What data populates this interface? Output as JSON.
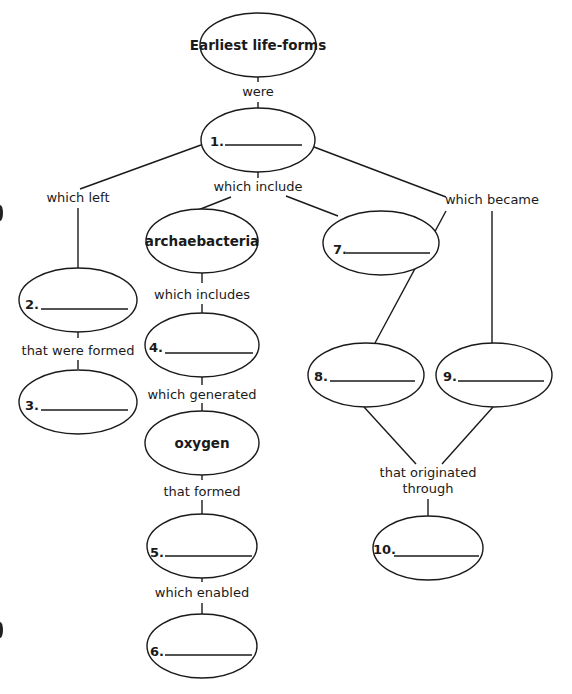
{
  "diagram": {
    "type": "concept-map",
    "nodes": {
      "root": "Earliest life-forms",
      "n1": "1.",
      "n2": "2.",
      "n3": "3.",
      "archaebacteria": "archaebacteria",
      "n4": "4.",
      "oxygen": "oxygen",
      "n5": "5.",
      "n6": "6.",
      "n7": "7.",
      "n8": "8.",
      "n9": "9.",
      "n10": "10."
    },
    "links": {
      "were": "were",
      "which_left": "which left",
      "which_include": "which include",
      "which_became": "which became",
      "which_includes": "which includes",
      "that_were_formed": "that were formed",
      "which_generated": "which generated",
      "that_formed": "that formed",
      "which_enabled": "which enabled",
      "that_originated_1": "that originated",
      "that_originated_2": "through"
    }
  }
}
